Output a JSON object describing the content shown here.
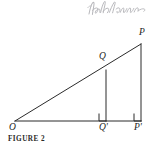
{
  "figure": {
    "caption": "FIGURE 2",
    "background_color": "#ffffff",
    "ink_color": "#2b2b2b",
    "handwriting_color": "#b9b9bd",
    "handwriting_note": "Radian",
    "labels": {
      "origin": "O",
      "mid_upper": "Q",
      "apex": "P",
      "mid_foot": "Q'",
      "apex_foot": "P'"
    },
    "geometry": {
      "points": {
        "O": {
          "x": 15,
          "y": 121
        },
        "Q": {
          "x": 106,
          "y": 70
        },
        "P": {
          "x": 141,
          "y": 44
        },
        "Qp": {
          "x": 106,
          "y": 121
        },
        "Pp": {
          "x": 141,
          "y": 121
        }
      },
      "segments": [
        {
          "name": "hypotenuse-O-P",
          "from": "O",
          "to": "P"
        },
        {
          "name": "base-O-Pp",
          "from": "O",
          "to": "Pp"
        },
        {
          "name": "vertical-Q-Qp",
          "from": "Q",
          "to": "Qp"
        },
        {
          "name": "vertical-P-Pp",
          "from": "P",
          "to": "Pp"
        }
      ],
      "right_angles": [
        {
          "name": "right-angle-Qp",
          "x": 99,
          "y": 114,
          "size": 7
        },
        {
          "name": "right-angle-Pp",
          "x": 134,
          "y": 114,
          "size": 7
        }
      ]
    }
  }
}
